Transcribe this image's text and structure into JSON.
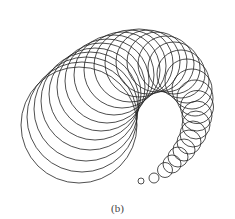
{
  "figure": {
    "caption": "(b)",
    "stroke_color": "#222222",
    "circles": [
      {
        "cx": 79,
        "cy": 125,
        "r": 58
      },
      {
        "cx": 82,
        "cy": 117,
        "r": 55
      },
      {
        "cx": 86,
        "cy": 109,
        "r": 52
      },
      {
        "cx": 90,
        "cy": 101,
        "r": 49
      },
      {
        "cx": 95,
        "cy": 94,
        "r": 46
      },
      {
        "cx": 101,
        "cy": 87,
        "r": 44
      },
      {
        "cx": 107,
        "cy": 81,
        "r": 42
      },
      {
        "cx": 114,
        "cy": 75,
        "r": 40
      },
      {
        "cx": 122,
        "cy": 70,
        "r": 38
      },
      {
        "cx": 130,
        "cy": 66,
        "r": 36
      },
      {
        "cx": 139,
        "cy": 63,
        "r": 34
      },
      {
        "cx": 148,
        "cy": 62,
        "r": 32
      },
      {
        "cx": 157,
        "cy": 62,
        "r": 30
      },
      {
        "cx": 166,
        "cy": 64,
        "r": 28
      },
      {
        "cx": 174,
        "cy": 68,
        "r": 26
      },
      {
        "cx": 181,
        "cy": 74,
        "r": 24
      },
      {
        "cx": 187,
        "cy": 81,
        "r": 22
      },
      {
        "cx": 192,
        "cy": 89,
        "r": 20
      },
      {
        "cx": 195,
        "cy": 98,
        "r": 18
      },
      {
        "cx": 197,
        "cy": 107,
        "r": 16.5
      },
      {
        "cx": 197,
        "cy": 116,
        "r": 15
      },
      {
        "cx": 196,
        "cy": 125,
        "r": 14
      },
      {
        "cx": 193,
        "cy": 134,
        "r": 13
      },
      {
        "cx": 189,
        "cy": 142,
        "r": 12
      },
      {
        "cx": 184,
        "cy": 150,
        "r": 11
      },
      {
        "cx": 178,
        "cy": 157,
        "r": 10
      },
      {
        "cx": 172,
        "cy": 164,
        "r": 9
      },
      {
        "cx": 165,
        "cy": 170,
        "r": 7.5
      },
      {
        "cx": 154,
        "cy": 178,
        "r": 5
      },
      {
        "cx": 141,
        "cy": 181,
        "r": 3
      }
    ]
  }
}
